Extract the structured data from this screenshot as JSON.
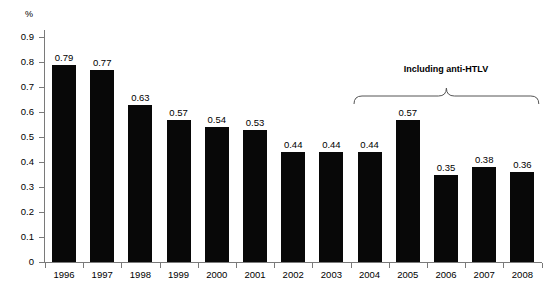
{
  "chart_data": {
    "type": "bar",
    "title": "",
    "subtitle": "",
    "xlabel": "",
    "ylabel": "%",
    "ylim": [
      0,
      0.9
    ],
    "ytick_labels": [
      "0.9",
      "0.8",
      "0.7",
      "0.6",
      "0.5",
      "0.4",
      "0.3",
      "0.2",
      "0.1",
      "0"
    ],
    "ytick_values": [
      0.9,
      0.8,
      0.7,
      0.6,
      0.5,
      0.4,
      0.3,
      0.2,
      0.1,
      0
    ],
    "grid": false,
    "legend": null,
    "categories": [
      "1996",
      "1997",
      "1998",
      "1999",
      "2000",
      "2001",
      "2002",
      "2003",
      "2004",
      "2005",
      "2006",
      "2007",
      "2008"
    ],
    "values": [
      0.79,
      0.77,
      0.63,
      0.57,
      0.54,
      0.53,
      0.44,
      0.44,
      0.44,
      0.57,
      0.35,
      0.38,
      0.36
    ],
    "value_labels": [
      "0.79",
      "0.77",
      "0.63",
      "0.57",
      "0.54",
      "0.53",
      "0.44",
      "0.44",
      "0.44",
      "0.57",
      "0.35",
      "0.38",
      "0.36"
    ],
    "bar_color": "#080808",
    "axis_color": "#7a7a7a",
    "annotations": [
      {
        "text": "Including anti-HTLV",
        "type": "brace",
        "span_start_category": "2004",
        "span_end_category": "2008"
      }
    ]
  }
}
